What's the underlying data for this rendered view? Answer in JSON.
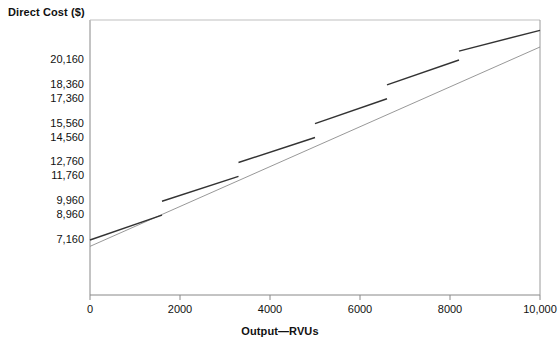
{
  "chart_data": {
    "type": "line",
    "title": "",
    "xlabel": "Output—RVUs",
    "ylabel": "Direct Cost ($)",
    "xlim": [
      0,
      10000
    ],
    "ylim": [
      0,
      22400
    ],
    "grid": false,
    "legend": "none",
    "xticks": [
      {
        "value": 0,
        "label": "0"
      },
      {
        "value": 2000,
        "label": "2000"
      },
      {
        "value": 4000,
        "label": "4000"
      },
      {
        "value": 6000,
        "label": "6000"
      },
      {
        "value": 8000,
        "label": "8000"
      },
      {
        "value": 10000,
        "label": "10,000"
      }
    ],
    "yticks": [
      {
        "value": 20160,
        "label": "20,160"
      },
      {
        "value": 18360,
        "label": "18,360"
      },
      {
        "value": 17360,
        "label": "17,360"
      },
      {
        "value": 15560,
        "label": "15,560"
      },
      {
        "value": 14560,
        "label": "14,560"
      },
      {
        "value": 12760,
        "label": "12,760"
      },
      {
        "value": 11760,
        "label": "11,760"
      },
      {
        "value": 9960,
        "label": "9,960"
      },
      {
        "value": 8960,
        "label": "8,960"
      },
      {
        "value": 7160,
        "label": "7,160"
      }
    ],
    "series": [
      {
        "name": "total-direct-cost-line",
        "type": "line",
        "style": "thin",
        "color": "#8c8c8c",
        "points": [
          {
            "x": 0,
            "y": 6700
          },
          {
            "x": 10000,
            "y": 21100
          }
        ]
      },
      {
        "name": "relevant-range-segments",
        "type": "segments",
        "style": "thick",
        "color": "#333333",
        "segments": [
          {
            "x1": 0,
            "y1": 7160,
            "x2": 1600,
            "y2": 8960
          },
          {
            "x1": 1600,
            "y1": 9960,
            "x2": 3300,
            "y2": 11760
          },
          {
            "x1": 3300,
            "y1": 12760,
            "x2": 5000,
            "y2": 14560
          },
          {
            "x1": 5000,
            "y1": 15560,
            "x2": 6600,
            "y2": 17360
          },
          {
            "x1": 6600,
            "y1": 18360,
            "x2": 8200,
            "y2": 20160
          },
          {
            "x1": 8200,
            "y1": 20800,
            "x2": 10000,
            "y2": 22300
          }
        ]
      }
    ]
  },
  "axes": {
    "y_axis_name": "direct-cost-axis",
    "x_axis_name": "output-axis"
  }
}
